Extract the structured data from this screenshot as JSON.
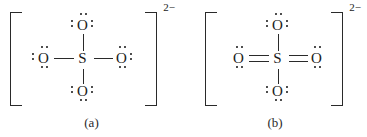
{
  "figure": {
    "background_color": "#ffffff",
    "ink_color": "#1a1a1a"
  },
  "structures": [
    {
      "id": "a",
      "caption": "(a)",
      "charge": "2−",
      "central_atom": "S",
      "bracket": "square",
      "oxygens": [
        {
          "position": "top",
          "symbol": "O",
          "bond": "single",
          "lone_pairs": 3,
          "lone_pair_sides": [
            "top",
            "left",
            "right"
          ]
        },
        {
          "position": "left",
          "symbol": "O",
          "bond": "single",
          "lone_pairs": 3,
          "lone_pair_sides": [
            "left",
            "top",
            "bottom"
          ]
        },
        {
          "position": "right",
          "symbol": "O",
          "bond": "single",
          "lone_pairs": 3,
          "lone_pair_sides": [
            "right",
            "top",
            "bottom"
          ]
        },
        {
          "position": "bottom",
          "symbol": "O",
          "bond": "single",
          "lone_pairs": 3,
          "lone_pair_sides": [
            "bottom",
            "left",
            "right"
          ]
        }
      ]
    },
    {
      "id": "b",
      "caption": "(b)",
      "charge": "2−",
      "central_atom": "S",
      "bracket": "square",
      "oxygens": [
        {
          "position": "top",
          "symbol": "O",
          "bond": "single",
          "lone_pairs": 3,
          "lone_pair_sides": [
            "top",
            "left",
            "right"
          ]
        },
        {
          "position": "left",
          "symbol": "O",
          "bond": "double",
          "lone_pairs": 2,
          "lone_pair_sides": [
            "top",
            "bottom"
          ]
        },
        {
          "position": "right",
          "symbol": "O",
          "bond": "double",
          "lone_pairs": 2,
          "lone_pair_sides": [
            "top",
            "bottom"
          ]
        },
        {
          "position": "bottom",
          "symbol": "O",
          "bond": "single",
          "lone_pairs": 3,
          "lone_pair_sides": [
            "bottom",
            "left",
            "right"
          ]
        }
      ]
    }
  ]
}
